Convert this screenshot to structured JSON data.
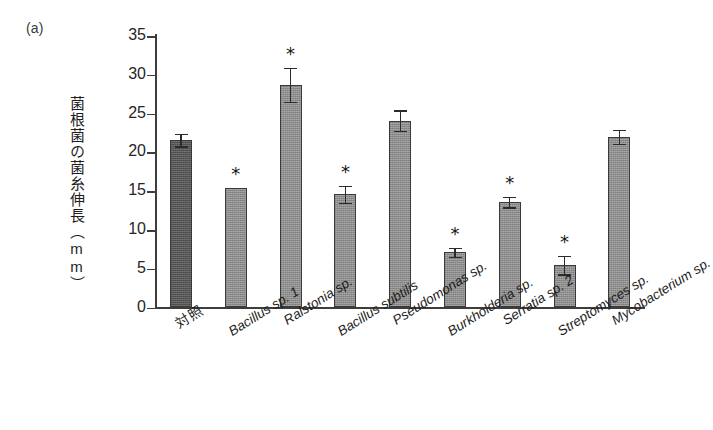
{
  "panel": {
    "label": "(a)"
  },
  "chart_data": {
    "type": "bar",
    "title": "",
    "xlabel": "",
    "ylabel": "菌根菌の菌糸伸長（mm）",
    "ylim": [
      0,
      35
    ],
    "ytick_labels": [
      "35",
      "30",
      "25",
      "20",
      "15",
      "10",
      "5",
      "0"
    ],
    "ytick_values": [
      35,
      30,
      25,
      20,
      15,
      10,
      5,
      0
    ],
    "grid": false,
    "legend": "none",
    "categories": [
      "対照",
      "Bacillus sp. 1",
      "Ralstonia sp.",
      "Bacillus subtilis",
      "Pseudomonas sp.",
      "Burkholderia sp.",
      "Serratia sp. 2",
      "Streptomyces sp.",
      "Mycobacterium sp."
    ],
    "category_styles": [
      "plain",
      "italic",
      "italic",
      "italic",
      "italic",
      "italic",
      "italic",
      "italic",
      "italic"
    ],
    "values": [
      21.6,
      15.4,
      28.7,
      14.6,
      24.1,
      7.1,
      13.6,
      5.5,
      22.0
    ],
    "errors": [
      0.8,
      0.0,
      2.2,
      1.1,
      1.3,
      0.6,
      0.7,
      1.2,
      0.9
    ],
    "significance": [
      "",
      "*",
      "*",
      "*",
      "",
      "*",
      "*",
      "*",
      ""
    ],
    "bar_colors": [
      "#555555",
      "#8d8d8d",
      "#8d8d8d",
      "#8d8d8d",
      "#8d8d8d",
      "#8d8d8d",
      "#8d8d8d",
      "#8d8d8d",
      "#8d8d8d"
    ],
    "significance_note": "* indicates significant difference from control",
    "axis_color": "#3d3d3d"
  }
}
